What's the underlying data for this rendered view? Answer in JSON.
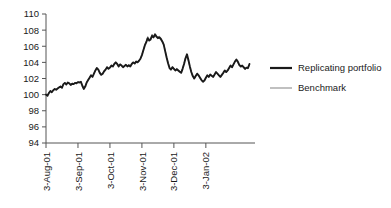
{
  "chart_data": {
    "type": "line",
    "title": "",
    "subtitle": "",
    "xlabel": "",
    "ylabel": "",
    "ylim": [
      94,
      110
    ],
    "ytick_step": 2,
    "yticks": [
      94,
      96,
      98,
      100,
      102,
      104,
      106,
      108,
      110
    ],
    "ytick_labels": [
      "94",
      "96",
      "98",
      "100",
      "102",
      "104",
      "106",
      "108",
      "110"
    ],
    "xticks": [
      0,
      22,
      44,
      66,
      88,
      110
    ],
    "xtick_labels": [
      "3-Aug-01",
      "3-Sep-01",
      "3-Oct-01",
      "3-Nov-01",
      "3-Dec-01",
      "3-Jan-02"
    ],
    "xlim": [
      0,
      139
    ],
    "grid": false,
    "legend_position": "right",
    "x_index_count": 140,
    "series": [
      {
        "name": "Replicating portfolio",
        "color": "#1a1a1a",
        "width": 1.9,
        "values": [
          100.0,
          99.85,
          100.2,
          100.45,
          100.3,
          100.55,
          100.7,
          100.6,
          100.75,
          100.9,
          101.0,
          100.85,
          101.3,
          101.45,
          101.25,
          101.5,
          101.4,
          101.2,
          101.35,
          101.3,
          101.45,
          101.4,
          101.55,
          101.5,
          101.6,
          101.1,
          100.7,
          101.0,
          101.5,
          101.8,
          102.1,
          102.4,
          102.2,
          102.6,
          103.0,
          103.3,
          103.1,
          102.7,
          102.45,
          102.6,
          102.9,
          103.1,
          103.4,
          103.2,
          103.35,
          103.6,
          103.5,
          103.8,
          104.0,
          103.8,
          103.5,
          103.75,
          103.6,
          103.4,
          103.55,
          103.7,
          103.5,
          103.65,
          103.5,
          103.8,
          104.0,
          103.85,
          104.1,
          104.0,
          104.2,
          104.45,
          104.9,
          105.5,
          106.1,
          106.5,
          107.0,
          106.7,
          106.85,
          107.3,
          107.1,
          107.45,
          107.2,
          107.0,
          107.1,
          106.9,
          106.6,
          106.2,
          105.4,
          104.6,
          103.9,
          103.3,
          103.1,
          103.4,
          103.2,
          103.0,
          103.15,
          103.0,
          102.85,
          102.7,
          103.2,
          103.8,
          104.5,
          105.0,
          104.3,
          103.5,
          102.8,
          102.3,
          102.0,
          102.3,
          102.6,
          102.4,
          102.1,
          101.8,
          101.6,
          101.75,
          102.1,
          102.4,
          102.2,
          102.5,
          102.35,
          102.2,
          102.5,
          102.8,
          102.6,
          102.4,
          102.2,
          102.45,
          102.7,
          103.0,
          102.8,
          103.0,
          103.3,
          103.6,
          103.4,
          103.75,
          104.1,
          104.35,
          104.1,
          103.7,
          103.5,
          103.6,
          103.4,
          103.2,
          103.35,
          103.3,
          103.8
        ]
      },
      {
        "name": "Benchmark",
        "color": "#8c8c8c",
        "width": 1.0,
        "values": [
          100.0,
          99.9,
          100.25,
          100.5,
          100.35,
          100.6,
          100.75,
          100.65,
          100.8,
          100.95,
          101.05,
          100.9,
          101.35,
          101.5,
          101.3,
          101.55,
          101.45,
          101.25,
          101.4,
          101.35,
          101.5,
          101.45,
          101.6,
          101.55,
          101.65,
          101.15,
          100.75,
          101.05,
          101.55,
          101.85,
          102.15,
          102.45,
          102.25,
          102.65,
          103.05,
          103.35,
          103.15,
          102.75,
          102.5,
          102.65,
          102.95,
          103.15,
          103.45,
          103.25,
          103.4,
          103.65,
          103.55,
          103.85,
          104.05,
          103.85,
          103.55,
          103.8,
          103.65,
          103.45,
          103.6,
          103.75,
          103.55,
          103.7,
          103.55,
          103.85,
          104.05,
          103.9,
          104.15,
          104.05,
          104.25,
          104.5,
          104.95,
          105.55,
          106.2,
          106.6,
          107.2,
          106.85,
          107.0,
          107.5,
          107.25,
          107.6,
          107.35,
          107.15,
          107.25,
          107.05,
          106.7,
          106.3,
          105.5,
          104.7,
          104.0,
          103.4,
          103.2,
          103.5,
          103.3,
          103.1,
          103.25,
          103.1,
          102.95,
          102.8,
          103.3,
          103.9,
          104.6,
          104.8,
          104.15,
          103.4,
          102.75,
          102.25,
          101.95,
          102.25,
          102.55,
          102.35,
          102.05,
          101.75,
          101.55,
          101.7,
          102.05,
          102.35,
          102.15,
          102.45,
          102.3,
          102.15,
          102.45,
          102.75,
          102.55,
          102.35,
          102.15,
          102.4,
          102.65,
          102.95,
          102.75,
          102.95,
          103.25,
          103.55,
          103.35,
          103.7,
          104.05,
          104.2,
          103.95,
          103.6,
          103.4,
          103.5,
          103.3,
          103.1,
          103.25,
          103.2,
          103.7
        ]
      }
    ]
  },
  "legend": {
    "items": [
      {
        "label": "Replicating portfolio",
        "color": "#1a1a1a",
        "width": 2.2
      },
      {
        "label": "Benchmark",
        "color": "#8c8c8c",
        "width": 1.1
      }
    ]
  },
  "axes": {
    "axis_color": "#555555",
    "tick_color": "#555555"
  }
}
